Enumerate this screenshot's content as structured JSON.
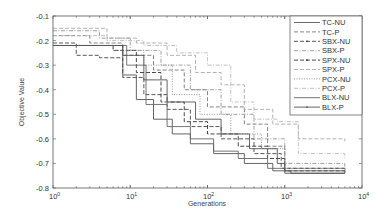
{
  "chart_data": {
    "type": "line",
    "title": "",
    "xlabel": "Generations",
    "ylabel": "Objective Value",
    "xscale": "log",
    "xlim": [
      1,
      10000
    ],
    "ylim": [
      -0.8,
      -0.1
    ],
    "xticks": [
      1,
      10,
      100,
      1000,
      10000
    ],
    "xtick_labels": [
      "10^0",
      "10^1",
      "10^2",
      "10^3",
      "10^4"
    ],
    "yticks": [
      -0.1,
      -0.2,
      -0.3,
      -0.4,
      -0.5,
      -0.6,
      -0.7,
      -0.8
    ],
    "ytick_labels": [
      "-0.1",
      "-0.2",
      "-0.3",
      "-0.4",
      "-0.5",
      "-0.6",
      "-0.7",
      "-0.8"
    ],
    "grid": false,
    "legend_position": "upper right",
    "series": [
      {
        "name": "TC-NU",
        "style": "solid",
        "color": "#555555",
        "x": [
          1,
          5,
          8,
          12,
          20,
          35,
          60,
          120,
          300,
          700,
          1200,
          6000
        ],
        "y": [
          -0.22,
          -0.22,
          -0.34,
          -0.44,
          -0.52,
          -0.58,
          -0.62,
          -0.66,
          -0.7,
          -0.73,
          -0.74,
          -0.74
        ]
      },
      {
        "name": "TC-P",
        "style": "dashed",
        "color": "#777777",
        "x": [
          1,
          3,
          8,
          20,
          50,
          100,
          300,
          600,
          1000,
          6000
        ],
        "y": [
          -0.18,
          -0.21,
          -0.26,
          -0.32,
          -0.4,
          -0.47,
          -0.54,
          -0.63,
          -0.72,
          -0.73
        ]
      },
      {
        "name": "SBX-NU",
        "style": "dashmarker",
        "color": "#444444",
        "x": [
          1,
          2,
          4,
          8,
          15,
          30,
          60,
          150,
          400,
          900,
          3000,
          6000
        ],
        "y": [
          -0.21,
          -0.26,
          -0.27,
          -0.35,
          -0.42,
          -0.48,
          -0.55,
          -0.6,
          -0.66,
          -0.72,
          -0.72,
          -0.74
        ]
      },
      {
        "name": "SBX-P",
        "style": "dashdot",
        "color": "#999999",
        "x": [
          1,
          4,
          10,
          25,
          60,
          150,
          400,
          1000,
          6000
        ],
        "y": [
          -0.16,
          -0.19,
          -0.24,
          -0.3,
          -0.4,
          -0.5,
          -0.6,
          -0.7,
          -0.73
        ]
      },
      {
        "name": "SPX-NU",
        "style": "dashmarker",
        "color": "#333333",
        "x": [
          1,
          3,
          6,
          12,
          25,
          50,
          100,
          250,
          600,
          1000,
          6000
        ],
        "y": [
          -0.22,
          -0.22,
          -0.24,
          -0.33,
          -0.45,
          -0.53,
          -0.58,
          -0.63,
          -0.68,
          -0.73,
          -0.74
        ]
      },
      {
        "name": "SPX-P",
        "style": "dashed",
        "color": "#aaaaaa",
        "x": [
          1,
          5,
          12,
          30,
          70,
          150,
          300,
          700,
          1500,
          6000
        ],
        "y": [
          -0.15,
          -0.19,
          -0.21,
          -0.26,
          -0.33,
          -0.38,
          -0.48,
          -0.54,
          -0.6,
          -0.61
        ]
      },
      {
        "name": "PCX-NU",
        "style": "dotted",
        "color": "#888888",
        "x": [
          1,
          6,
          15,
          35,
          80,
          200,
          500,
          1000,
          6000
        ],
        "y": [
          -0.22,
          -0.24,
          -0.3,
          -0.42,
          -0.5,
          -0.58,
          -0.64,
          -0.72,
          -0.74
        ]
      },
      {
        "name": "PCX-P",
        "style": "dashdot",
        "color": "#bbbbbb",
        "x": [
          1,
          5,
          15,
          40,
          100,
          200,
          400,
          800,
          1500,
          6000
        ],
        "y": [
          -0.18,
          -0.2,
          -0.22,
          -0.25,
          -0.3,
          -0.45,
          -0.52,
          -0.53,
          -0.66,
          -0.68
        ]
      },
      {
        "name": "BLX-NU",
        "style": "solid",
        "color": "#666666",
        "x": [
          1,
          5,
          9,
          16,
          30,
          60,
          120,
          250,
          600,
          1000,
          6000
        ],
        "y": [
          -0.22,
          -0.22,
          -0.3,
          -0.46,
          -0.55,
          -0.6,
          -0.65,
          -0.68,
          -0.72,
          -0.73,
          -0.73
        ]
      },
      {
        "name": "BLX-P",
        "style": "solidmarker",
        "color": "#555555",
        "x": [
          1,
          4,
          8,
          15,
          30,
          70,
          150,
          350,
          800,
          1000,
          6000
        ],
        "y": [
          -0.22,
          -0.22,
          -0.26,
          -0.36,
          -0.45,
          -0.52,
          -0.58,
          -0.64,
          -0.7,
          -0.74,
          -0.74
        ]
      }
    ]
  },
  "axes": {
    "xlabel": "Generations",
    "ylabel": "Objective Value",
    "ytick_labels": [
      "-0.1",
      "-0.2",
      "-0.3",
      "-0.4",
      "-0.5",
      "-0.6",
      "-0.7",
      "-0.8"
    ],
    "xtick_bases": [
      "10",
      "10",
      "10",
      "10",
      "10"
    ],
    "xtick_exps": [
      "0",
      "1",
      "2",
      "3",
      "4"
    ]
  },
  "legend": {
    "entries": [
      "TC-NU",
      "TC-P",
      "SBX-NU",
      "SBX-P",
      "SPX-NU",
      "SPX-P",
      "PCX-NU",
      "PCX-P",
      "BLX-NU",
      "BLX-P"
    ]
  }
}
